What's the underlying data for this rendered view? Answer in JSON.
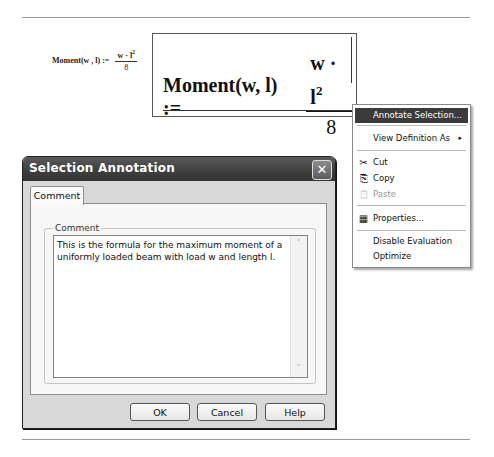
{
  "worksheet": {
    "small_formula": {
      "lhs": "Moment(w , l) :=",
      "numerator_base": "w · l",
      "numerator_exp": "2",
      "denominator": "8"
    },
    "big_formula": {
      "lhs": "Moment(w, l) :=",
      "numerator_base": "w · l",
      "numerator_exp": "2",
      "denominator": "8"
    }
  },
  "context_menu": {
    "items": [
      {
        "label": "Annotate Selection...",
        "highlighted": true
      },
      {
        "label": "View Definition As",
        "submenu_arrow": "▸"
      },
      {
        "label": "Cut",
        "icon": "✂"
      },
      {
        "label": "Copy",
        "icon": "⎘"
      },
      {
        "label": "Paste",
        "icon": "📋",
        "disabled": true
      },
      {
        "label": "Properties...",
        "icon": "▦"
      },
      {
        "label": "Disable Evaluation"
      },
      {
        "label": "Optimize"
      }
    ]
  },
  "dialog": {
    "title": "Selection Annotation",
    "close_glyph": "✕",
    "tabs": [
      {
        "label": "Comment",
        "active": true
      }
    ],
    "group_label": "Comment",
    "comment_text": "This is the formula for the maximum moment of a uniformly loaded beam with load w and length l.",
    "scroll_up_glyph": "˄",
    "scroll_down_glyph": "˅",
    "buttons": {
      "ok": "OK",
      "cancel": "Cancel",
      "help": "Help"
    }
  }
}
